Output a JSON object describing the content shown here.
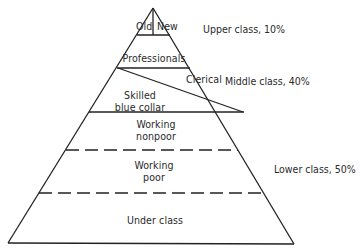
{
  "diagram": {
    "type": "class-pyramid",
    "tiers": [
      {
        "id": "upper",
        "segments": [
          {
            "label": "Old"
          },
          {
            "label": "New"
          }
        ]
      },
      {
        "id": "professionals",
        "label": "Professionals"
      },
      {
        "id": "clerical",
        "label": "Clerical"
      },
      {
        "id": "skilled",
        "label_line1": "Skilled",
        "label_line2": "blue collar"
      },
      {
        "id": "working-nonpoor",
        "label_line1": "Working",
        "label_line2": "nonpoor"
      },
      {
        "id": "working-poor",
        "label_line1": "Working",
        "label_line2": "poor"
      },
      {
        "id": "under-class",
        "label": "Under class"
      }
    ],
    "class_groups": [
      {
        "label": "Upper class, 10%",
        "percent": 10
      },
      {
        "label": "Middle class, 40%",
        "percent": 40
      },
      {
        "label": "Lower class, 50%",
        "percent": 50
      }
    ],
    "line_color": "#222222"
  }
}
